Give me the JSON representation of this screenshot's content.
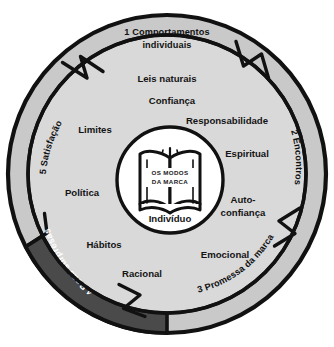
{
  "diagram": {
    "title": "Os Modos da Marca",
    "type": "concentric-cycle",
    "colors": {
      "outer_ring_fill": "#c9c9c9",
      "inner_ring_fill": "#d9d9d9",
      "highlight_segment_fill": "#4a4a4a",
      "core_fill": "#ffffff",
      "stroke": "#111111",
      "text_dark": "#141414",
      "text_light": "#ffffff",
      "background": "#ffffff"
    },
    "outer_ring": {
      "name": "stages-ring",
      "segments": [
        {
          "id": "s1",
          "label": "1 Comportamentos",
          "label2": "individuais",
          "number": "1",
          "text": "1 Comportamentos individuais",
          "position": "top",
          "highlighted": false
        },
        {
          "id": "s2",
          "label": "2 Encontros",
          "number": "2",
          "text": "2 Encontros",
          "position": "right",
          "highlighted": false
        },
        {
          "id": "s3",
          "label": "3 Promessa da marca",
          "number": "3",
          "text": "3 Promessa da marca",
          "position": "bottom-right",
          "highlighted": false
        },
        {
          "id": "s4",
          "label": "4 Boas surpresas",
          "number": "4",
          "text": "4 Boas surpresas",
          "position": "bottom-left",
          "highlighted": true
        },
        {
          "id": "s5",
          "label": "5 Satisfação",
          "number": "5",
          "text": "5 Satisfação",
          "position": "left",
          "highlighted": false
        }
      ]
    },
    "inner_ring": {
      "name": "attributes-ring",
      "items": [
        {
          "id": "a1",
          "label": "Leis naturais",
          "position": "top"
        },
        {
          "id": "a2",
          "label": "Confiança",
          "position": "top"
        },
        {
          "id": "a3",
          "label": "Responsabilidade",
          "position": "upper-right"
        },
        {
          "id": "a4",
          "label": "Espiritual",
          "position": "right"
        },
        {
          "id": "a5",
          "label": "Auto-",
          "label2": "confiança",
          "text": "Auto-confiança",
          "position": "lower-right"
        },
        {
          "id": "a6",
          "label": "Emocional",
          "position": "bottom-right"
        },
        {
          "id": "a7",
          "label": "Racional",
          "position": "bottom"
        },
        {
          "id": "a8",
          "label": "Hábitos",
          "position": "bottom-left"
        },
        {
          "id": "a9",
          "label": "Política",
          "position": "left"
        },
        {
          "id": "a10",
          "label": "Limites",
          "position": "upper-left"
        }
      ]
    },
    "core": {
      "name": "core-circle",
      "icon": "open-book-icon",
      "title_line1": "OS MODOS",
      "title_line2": "DA MARCA",
      "caption": "Indivíduo"
    }
  }
}
